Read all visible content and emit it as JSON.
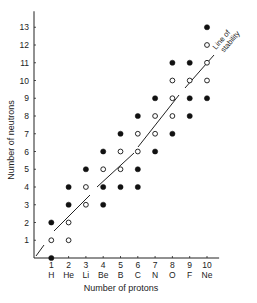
{
  "chart_data": {
    "type": "scatter",
    "title": "",
    "xlabel": "Number of protons",
    "ylabel": "Number of neutrons",
    "xlim": [
      0,
      10.5
    ],
    "ylim": [
      0,
      13.5
    ],
    "x_ticks": [
      1,
      2,
      3,
      4,
      5,
      6,
      7,
      8,
      9,
      10
    ],
    "x_tick_elements": [
      "H",
      "He",
      "Li",
      "Be",
      "B",
      "C",
      "N",
      "O",
      "F",
      "Ne"
    ],
    "y_ticks": [
      1,
      2,
      3,
      4,
      5,
      6,
      7,
      8,
      9,
      10,
      11,
      12,
      13
    ],
    "grid": false,
    "legend": null,
    "annotations": [
      {
        "text": "Line of stability",
        "position": "upper right, along line"
      }
    ],
    "line_of_stability": {
      "from": [
        0,
        0
      ],
      "to": [
        10.5,
        12
      ],
      "style": "broken segments"
    },
    "series": [
      {
        "name": "stable (open circles)",
        "marker": "open",
        "points": [
          [
            1,
            1
          ],
          [
            2,
            1
          ],
          [
            2,
            2
          ],
          [
            3,
            3
          ],
          [
            3,
            4
          ],
          [
            4,
            5
          ],
          [
            5,
            5
          ],
          [
            5,
            6
          ],
          [
            6,
            6
          ],
          [
            6,
            7
          ],
          [
            7,
            7
          ],
          [
            7,
            8
          ],
          [
            8,
            8
          ],
          [
            8,
            9
          ],
          [
            8,
            10
          ],
          [
            9,
            10
          ],
          [
            10,
            10
          ],
          [
            10,
            11
          ],
          [
            10,
            12
          ]
        ]
      },
      {
        "name": "unstable (filled circles)",
        "marker": "filled",
        "points": [
          [
            1,
            0
          ],
          [
            1,
            2
          ],
          [
            2,
            3
          ],
          [
            2,
            4
          ],
          [
            3,
            5
          ],
          [
            4,
            3
          ],
          [
            4,
            4
          ],
          [
            4,
            6
          ],
          [
            5,
            4
          ],
          [
            5,
            7
          ],
          [
            6,
            4
          ],
          [
            6,
            5
          ],
          [
            6,
            8
          ],
          [
            7,
            6
          ],
          [
            7,
            9
          ],
          [
            8,
            7
          ],
          [
            8,
            11
          ],
          [
            9,
            8
          ],
          [
            9,
            9
          ],
          [
            9,
            11
          ],
          [
            10,
            9
          ],
          [
            10,
            13
          ]
        ]
      }
    ]
  }
}
